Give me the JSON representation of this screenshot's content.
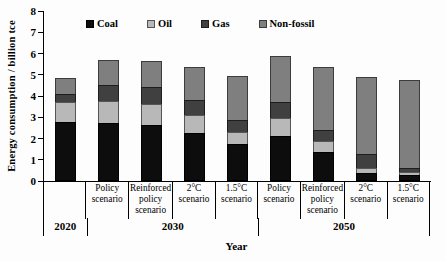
{
  "chart_data": {
    "type": "bar",
    "stacked": true,
    "title": "",
    "ylabel": "Energy consumption / billion tce",
    "xlabel": "Year",
    "ylim": [
      0,
      8
    ],
    "yticks": [
      0,
      1,
      2,
      3,
      4,
      5,
      6,
      7,
      8
    ],
    "grid": false,
    "legend_position": "top-inside",
    "categories": [
      "",
      "Policy scenario",
      "Reinforced policy scenario",
      "2°C scenario",
      "1.5°C scenario",
      "Policy scenario",
      "Reinforced policy scenario",
      "2°C scenario",
      "1.5°C scenario"
    ],
    "groups": [
      {
        "label": "2020",
        "span": 1
      },
      {
        "label": "2030",
        "span": 4
      },
      {
        "label": "2050",
        "span": 4
      }
    ],
    "series": [
      {
        "name": "Coal",
        "color": "#0d0d0d",
        "border": "#000000",
        "values": [
          2.8,
          2.75,
          2.65,
          2.25,
          1.75,
          2.1,
          1.35,
          0.4,
          0.3
        ]
      },
      {
        "name": "Oil",
        "color": "#b8b8b8",
        "border": "#555555",
        "values": [
          0.95,
          1.05,
          1.0,
          0.9,
          0.6,
          0.9,
          0.6,
          0.25,
          0.15
        ]
      },
      {
        "name": "Gas",
        "color": "#404040",
        "border": "#1d1d1d",
        "values": [
          0.45,
          0.8,
          0.85,
          0.75,
          0.6,
          0.8,
          0.55,
          0.7,
          0.25
        ]
      },
      {
        "name": "Non-fossil",
        "color": "#7f7f7f",
        "border": "#3c3c3c",
        "values": [
          0.8,
          1.25,
          1.3,
          1.6,
          2.15,
          2.25,
          3.0,
          3.7,
          4.2
        ]
      }
    ],
    "totals": [
      5.0,
      5.85,
      5.8,
      5.5,
      5.1,
      6.05,
      5.5,
      5.05,
      4.9
    ]
  }
}
